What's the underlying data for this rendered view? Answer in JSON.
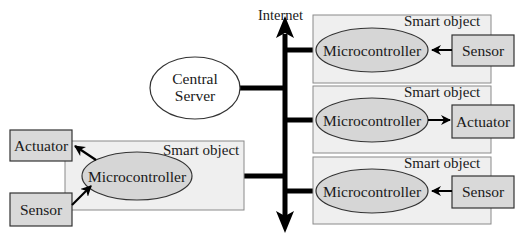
{
  "diagram": {
    "title": "",
    "network": {
      "label": "Internet"
    },
    "server": {
      "label_line1": "Central",
      "label_line2": "Server"
    },
    "smart_objects": [
      {
        "label": "Smart object",
        "controller": "Microcontroller",
        "device": "Sensor",
        "device_role": "input"
      },
      {
        "label": "Smart object",
        "controller": "Microcontroller",
        "device": "Actuator",
        "device_role": "output"
      },
      {
        "label": "Smart object",
        "controller": "Microcontroller",
        "device": "Sensor",
        "device_role": "input"
      },
      {
        "label": "Smart object",
        "controller": "Microcontroller",
        "devices": [
          "Actuator",
          "Sensor"
        ],
        "actuator": "Actuator",
        "sensor": "Sensor"
      }
    ],
    "colors": {
      "smart_object_fill": "#efefef",
      "device_fill": "#d9d9d9",
      "controller_fill": "#d6d6d6",
      "server_fill": "#ffffff",
      "line": "#000000"
    }
  }
}
